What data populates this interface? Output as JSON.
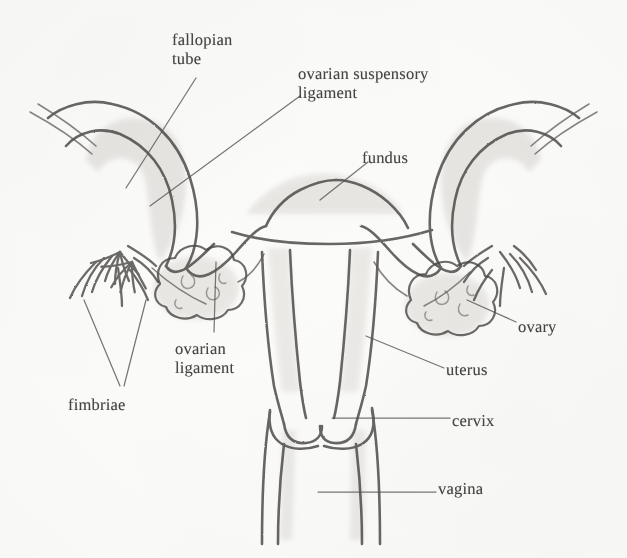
{
  "figure": {
    "medium": "pencil sketch scan",
    "background_color": "#fdfdfc",
    "ink_color": "#4a4744",
    "leader_color": "#55524f",
    "shade_color": "#cfcbc6"
  },
  "labels": [
    {
      "id": "fallopian-tube",
      "line1": "fallopian",
      "line2": "tube",
      "x": 172,
      "y": 30
    },
    {
      "id": "ovarian-suspensory-ligament",
      "line1": "ovarian suspensory",
      "line2": "ligament",
      "x": 298,
      "y": 64
    },
    {
      "id": "fundus",
      "line1": "fundus",
      "line2": "",
      "x": 362,
      "y": 148
    },
    {
      "id": "ovarian-ligament",
      "line1": "ovarian",
      "line2": "ligament",
      "x": 175,
      "y": 339
    },
    {
      "id": "fimbriae",
      "line1": "fimbriae",
      "line2": "",
      "x": 68,
      "y": 395
    },
    {
      "id": "ovary",
      "line1": "ovary",
      "line2": "",
      "x": 518,
      "y": 317
    },
    {
      "id": "uterus",
      "line1": "uterus",
      "line2": "",
      "x": 446,
      "y": 360
    },
    {
      "id": "cervix",
      "line1": "cervix",
      "line2": "",
      "x": 452,
      "y": 411
    },
    {
      "id": "vagina",
      "line1": "vagina",
      "line2": "",
      "x": 438,
      "y": 479
    }
  ],
  "structures": [
    {
      "id": "uterus-body",
      "name": "uterus"
    },
    {
      "id": "fundus-dome",
      "name": "fundus"
    },
    {
      "id": "cervix-neck",
      "name": "cervix"
    },
    {
      "id": "vaginal-canal",
      "name": "vagina"
    },
    {
      "id": "fallopian-tube-left",
      "name": "fallopian tube (left)"
    },
    {
      "id": "fallopian-tube-right",
      "name": "fallopian tube (right)"
    },
    {
      "id": "ovary-left",
      "name": "ovary (left)"
    },
    {
      "id": "ovary-right",
      "name": "ovary (right)"
    },
    {
      "id": "fimbriae-left",
      "name": "fimbriae (left)"
    },
    {
      "id": "fimbriae-right",
      "name": "fimbriae (right)"
    },
    {
      "id": "suspensory-ligament-left",
      "name": "ovarian suspensory ligament (left)"
    },
    {
      "id": "suspensory-ligament-right",
      "name": "ovarian suspensory ligament (right)"
    },
    {
      "id": "ovarian-ligament-left",
      "name": "ovarian ligament (left)"
    },
    {
      "id": "ovarian-ligament-right",
      "name": "ovarian ligament (right)"
    }
  ]
}
